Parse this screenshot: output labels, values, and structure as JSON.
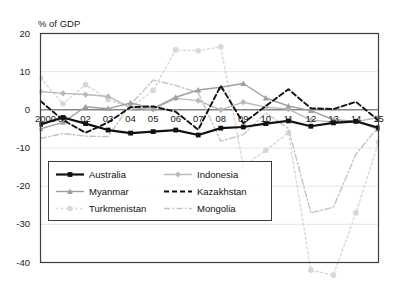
{
  "chart_data": {
    "type": "line",
    "title": "",
    "ylabel": "% of GDP",
    "xlabel": "",
    "ylim": [
      -40,
      20
    ],
    "yticks": [
      20,
      10,
      0,
      -10,
      -20,
      -30,
      -40
    ],
    "ytick_labels": [
      "20",
      "10",
      "0",
      "-10",
      "-20",
      "-30",
      "-40"
    ],
    "grid": true,
    "legend_position": "lower-left-inside",
    "x": [
      2000,
      2001,
      2002,
      2003,
      2004,
      2005,
      2006,
      2007,
      2008,
      2009,
      2010,
      2011,
      2012,
      2013,
      2014,
      2015
    ],
    "xtick_labels": [
      "2000",
      "01",
      "02",
      "03",
      "04",
      "05",
      "06",
      "07",
      "08",
      "09",
      "10",
      "11",
      "12",
      "13",
      "14",
      "15"
    ],
    "series": [
      {
        "name": "Australia",
        "color": "#111111",
        "style": "solid",
        "marker": "square",
        "values": [
          -3.8,
          -2.0,
          -3.6,
          -5.3,
          -6.1,
          -5.7,
          -5.3,
          -6.6,
          -4.8,
          -4.5,
          -3.6,
          -2.9,
          -4.3,
          -3.4,
          -3.0,
          -4.7
        ]
      },
      {
        "name": "Indonesia",
        "color": "#b9b9b9",
        "style": "solid",
        "marker": "diamond",
        "values": [
          4.8,
          4.3,
          4.0,
          3.5,
          0.6,
          0.1,
          3.0,
          2.4,
          0.0,
          2.0,
          0.7,
          0.2,
          -2.7,
          -3.2,
          -3.1,
          -2.0
        ]
      },
      {
        "name": "Myanmar",
        "color": "#a0a0a0",
        "style": "solid",
        "marker": "triangle",
        "values": [
          -5.0,
          -3.3,
          0.8,
          0.3,
          1.8,
          0.4,
          3.3,
          5.2,
          5.9,
          6.9,
          3.1,
          1.0,
          -0.2,
          -2.6,
          -3.0,
          -5.1
        ]
      },
      {
        "name": "Kazakhstan",
        "color": "#111111",
        "style": "dashed",
        "marker": "none",
        "values": [
          2.3,
          -2.7,
          -6.0,
          -3.3,
          0.7,
          0.9,
          -0.5,
          -5.2,
          6.3,
          -3.5,
          1.0,
          5.4,
          0.4,
          0.2,
          2.1,
          -2.8
        ]
      },
      {
        "name": "Turkmenistan",
        "color": "#d8d8d8",
        "style": "dotted",
        "marker": "circle",
        "values": [
          8.3,
          1.6,
          6.6,
          2.7,
          0.6,
          5.1,
          15.7,
          15.5,
          16.5,
          -14.8,
          -10.6,
          -6.0,
          -42.0,
          -43.3,
          -27.0,
          -8.5
        ]
      },
      {
        "name": "Mongolia",
        "color": "#c3c3c3",
        "style": "dashdot",
        "marker": "none",
        "values": [
          -7.5,
          -6.2,
          -6.9,
          -7.0,
          1.4,
          7.8,
          6.4,
          4.5,
          -8.2,
          -6.5,
          -0.8,
          -4.9,
          -27.0,
          -25.5,
          -11.6,
          -4.4
        ]
      }
    ]
  },
  "legend": {
    "items": [
      {
        "label": "Australia"
      },
      {
        "label": "Indonesia"
      },
      {
        "label": "Myanmar"
      },
      {
        "label": "Kazakhstan"
      },
      {
        "label": "Turkmenistan"
      },
      {
        "label": "Mongolia"
      }
    ]
  },
  "axes": {
    "ylabel_text": "% of GDP"
  }
}
